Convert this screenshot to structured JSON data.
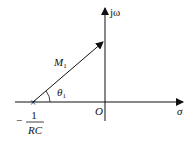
{
  "diagram": {
    "title": "",
    "axes": {
      "horizontal_label": "σ",
      "vertical_label": "jω",
      "origin_label": "O"
    },
    "vector": {
      "magnitude_label": "M",
      "magnitude_subscript": "1",
      "angle_label": "θ",
      "angle_subscript": "1"
    },
    "pole": {
      "marker": "×",
      "label_sign": "−",
      "label_numerator": "1",
      "label_denominator": "RC"
    },
    "colors": {
      "line": "#111111",
      "background": "#ffffff"
    }
  }
}
